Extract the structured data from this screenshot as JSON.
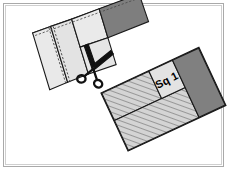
{
  "figure": {
    "kind": "quilting-instruction-illustration",
    "title": "",
    "background_color": "#ffffff",
    "frame": {
      "outer_border_color": "#a9a9a9",
      "inner_border_color": "#cfcfcf"
    },
    "colors": {
      "fabric_light": "#e8e8e8",
      "fabric_light_alt": "#dedede",
      "fabric_dark": "#808080",
      "fabric_dark_shade": "#6e6e6e",
      "hatch_fill": "#d0d0d0",
      "hatch_line": "#7a7a7a",
      "outline": "#1a1a1a",
      "stitch_dash": "#555555",
      "scissors": "#111111",
      "label_text": "#000000"
    },
    "labels": {
      "square_one": "Sq 1"
    },
    "icons": {
      "scissors": "scissors-icon"
    },
    "strip_set": {
      "name": "sewn-strip-set",
      "rotation_deg": -11,
      "pieces": [
        {
          "name": "light-strip-left",
          "shade": "light"
        },
        {
          "name": "light-strip-middle",
          "shade": "light"
        },
        {
          "name": "light-square-upper",
          "shade": "light"
        },
        {
          "name": "light-square-lower",
          "shade": "light"
        },
        {
          "name": "dark-rectangle-right",
          "shade": "dark"
        }
      ],
      "stitch_lines": 2
    },
    "finished_block": {
      "name": "finished-block",
      "rotation_deg": -25,
      "pieces": [
        {
          "name": "hatched-large-upper-left",
          "shade": "hatched"
        },
        {
          "name": "hatched-large-lower",
          "shade": "hatched"
        },
        {
          "name": "light-square-sq1",
          "shade": "light",
          "label": "Sq 1"
        },
        {
          "name": "dark-rectangle-right",
          "shade": "dark"
        }
      ]
    }
  }
}
